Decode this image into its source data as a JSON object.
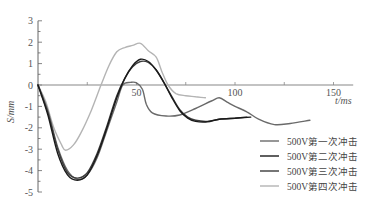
{
  "chart_data": {
    "type": "line",
    "title": "",
    "xlabel": "t/ms",
    "ylabel": "S/mm",
    "xlim": [
      0,
      160
    ],
    "ylim": [
      -5,
      3
    ],
    "x_ticks": [
      50,
      100,
      150
    ],
    "y_ticks": [
      3,
      2,
      1,
      0,
      -1,
      -2,
      -3,
      -4,
      -5
    ],
    "grid": false,
    "legend_position": "lower right",
    "series": [
      {
        "name": "500V第一次冲击",
        "color": "#6a6a6a",
        "points": [
          [
            0,
            0
          ],
          [
            5,
            -1.2
          ],
          [
            10,
            -2.9
          ],
          [
            15,
            -4.0
          ],
          [
            20,
            -4.4
          ],
          [
            25,
            -4.2
          ],
          [
            30,
            -3.4
          ],
          [
            35,
            -2.1
          ],
          [
            40,
            -0.8
          ],
          [
            43,
            0.0
          ],
          [
            47,
            0.12
          ],
          [
            50,
            0.1
          ],
          [
            53,
            -0.2
          ],
          [
            55,
            -0.9
          ],
          [
            58,
            -1.3
          ],
          [
            65,
            -1.45
          ],
          [
            72,
            -1.4
          ],
          [
            80,
            -1.1
          ],
          [
            88,
            -0.75
          ],
          [
            92,
            -0.6
          ],
          [
            96,
            -0.8
          ],
          [
            100,
            -1.0
          ],
          [
            106,
            -1.25
          ],
          [
            112,
            -1.6
          ],
          [
            120,
            -1.85
          ],
          [
            128,
            -1.8
          ],
          [
            138,
            -1.65
          ]
        ]
      },
      {
        "name": "500V第二次冲击",
        "color": "#1a1a1a",
        "points": [
          [
            0,
            0
          ],
          [
            5,
            -1.4
          ],
          [
            10,
            -3.2
          ],
          [
            15,
            -4.2
          ],
          [
            20,
            -4.45
          ],
          [
            25,
            -4.2
          ],
          [
            30,
            -3.3
          ],
          [
            35,
            -2.0
          ],
          [
            40,
            -0.6
          ],
          [
            44,
            0.3
          ],
          [
            48,
            0.9
          ],
          [
            52,
            1.2
          ],
          [
            56,
            1.1
          ],
          [
            60,
            0.7
          ],
          [
            64,
            0.1
          ],
          [
            68,
            -0.6
          ],
          [
            72,
            -1.2
          ],
          [
            76,
            -1.55
          ],
          [
            80,
            -1.7
          ],
          [
            86,
            -1.72
          ],
          [
            92,
            -1.6
          ],
          [
            100,
            -1.55
          ],
          [
            108,
            -1.5
          ]
        ]
      },
      {
        "name": "500V第三次冲击",
        "color": "#3c3c3c",
        "points": [
          [
            0,
            0
          ],
          [
            5,
            -1.3
          ],
          [
            10,
            -3.0
          ],
          [
            15,
            -4.1
          ],
          [
            20,
            -4.35
          ],
          [
            25,
            -4.1
          ],
          [
            30,
            -3.2
          ],
          [
            35,
            -1.9
          ],
          [
            40,
            -0.5
          ],
          [
            44,
            0.3
          ],
          [
            48,
            0.85
          ],
          [
            52,
            1.1
          ],
          [
            56,
            1.05
          ],
          [
            60,
            0.7
          ],
          [
            64,
            0.1
          ],
          [
            68,
            -0.55
          ],
          [
            72,
            -1.15
          ],
          [
            76,
            -1.5
          ],
          [
            80,
            -1.65
          ],
          [
            86,
            -1.7
          ],
          [
            92,
            -1.6
          ],
          [
            100,
            -1.55
          ],
          [
            106,
            -1.5
          ]
        ]
      },
      {
        "name": "500V第四次冲击",
        "color": "#b4b4b4",
        "points": [
          [
            0,
            0
          ],
          [
            4,
            -0.8
          ],
          [
            8,
            -2.0
          ],
          [
            12,
            -2.8
          ],
          [
            14,
            -3.05
          ],
          [
            18,
            -2.8
          ],
          [
            22,
            -2.2
          ],
          [
            27,
            -1.2
          ],
          [
            32,
            0.0
          ],
          [
            36,
            0.9
          ],
          [
            40,
            1.55
          ],
          [
            44,
            1.75
          ],
          [
            48,
            1.85
          ],
          [
            52,
            1.95
          ],
          [
            56,
            1.6
          ],
          [
            60,
            1.3
          ],
          [
            63,
            0.6
          ],
          [
            66,
            0.0
          ],
          [
            70,
            -0.4
          ],
          [
            75,
            -0.5
          ],
          [
            80,
            -0.55
          ],
          [
            85,
            -0.6
          ]
        ]
      }
    ]
  },
  "legend": {
    "items": [
      {
        "label": "500V第一次冲击",
        "color": "#6a6a6a"
      },
      {
        "label": "500V第二次冲击",
        "color": "#1a1a1a"
      },
      {
        "label": "500V第三次冲击",
        "color": "#3c3c3c"
      },
      {
        "label": "500V第四次冲击",
        "color": "#b4b4b4"
      }
    ]
  },
  "axes": {
    "x_label": "t/ms",
    "y_label": "S/mm",
    "x_tick_labels": [
      "50",
      "100",
      "150"
    ],
    "y_tick_labels": [
      "3",
      "2",
      "1",
      "0",
      "-1",
      "-2",
      "-3",
      "-4",
      "-5"
    ]
  }
}
